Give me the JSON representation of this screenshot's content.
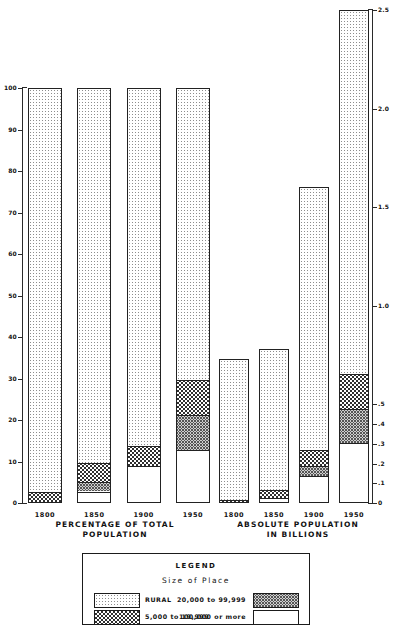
{
  "chart_data": [
    {
      "type": "bar",
      "title": "PERCENTAGE OF TOTAL POPULATION",
      "title_line1": "PERCENTAGE OF TOTAL",
      "title_line2": "POPULATION",
      "stacked": true,
      "xlabel": "",
      "ylabel": "",
      "ylim": [
        0,
        100
      ],
      "yticks": [
        0,
        10,
        20,
        30,
        40,
        50,
        60,
        70,
        80,
        90,
        100
      ],
      "ytick_labels": [
        "0",
        "10",
        "20",
        "30",
        "40",
        "50",
        "60",
        "70",
        "80",
        "90",
        "100"
      ],
      "grid": false,
      "legend_position": "bottom",
      "categories": [
        "1800",
        "1850",
        "1900",
        "1950"
      ],
      "series": [
        {
          "name": "100,000 or more",
          "pattern": "white",
          "values": [
            0.0,
            3.0,
            9.2,
            13.1
          ]
        },
        {
          "name": "20,000 to 99,999",
          "pattern": "hatch",
          "values": [
            0.0,
            2.2,
            0.0,
            8.4
          ]
        },
        {
          "name": "5,000 to 19,999",
          "pattern": "check",
          "values": [
            3.0,
            4.8,
            4.8,
            8.5
          ]
        },
        {
          "name": "RURAL",
          "pattern": "rural",
          "values": [
            97.0,
            90.0,
            86.0,
            70.0
          ]
        }
      ]
    },
    {
      "type": "bar",
      "title": "ABSOLUTE POPULATION IN BILLIONS",
      "title_line1": "ABSOLUTE POPULATION",
      "title_line2": "IN BILLIONS",
      "stacked": true,
      "xlabel": "",
      "ylabel": "",
      "ylim": [
        0,
        2.5
      ],
      "yticks": [
        0,
        0.1,
        0.2,
        0.3,
        0.4,
        0.5,
        1.0,
        1.5,
        2.0,
        2.5
      ],
      "ytick_labels": [
        "0",
        ".1",
        ".2",
        ".3",
        ".4",
        ".5",
        "1.0",
        "1.5",
        "2.0",
        "2.5"
      ],
      "grid": false,
      "legend_position": "bottom",
      "categories": [
        "1800",
        "1850",
        "1900",
        "1950"
      ],
      "series": [
        {
          "name": "100,000 or more",
          "pattern": "white",
          "values": [
            0.0,
            0.03,
            0.14,
            0.31
          ]
        },
        {
          "name": "20,000 to 99,999",
          "pattern": "hatch",
          "values": [
            0.0,
            0.0,
            0.05,
            0.17
          ]
        },
        {
          "name": "5,000 to 19,999",
          "pattern": "check",
          "values": [
            0.02,
            0.04,
            0.08,
            0.18
          ]
        },
        {
          "name": "RURAL",
          "pattern": "rural",
          "values": [
            0.71,
            0.71,
            1.33,
            1.84
          ]
        }
      ],
      "totals": [
        0.73,
        0.78,
        1.6,
        2.5
      ]
    }
  ],
  "legend": {
    "title": "LEGEND",
    "subtitle": "Size of Place",
    "items": [
      {
        "label": "RURAL",
        "pattern": "rural"
      },
      {
        "label": "20,000 to 99,999",
        "pattern": "hatch"
      },
      {
        "label": "5,000 to 19,999",
        "pattern": "check"
      },
      {
        "label": "100,000 or more",
        "pattern": "white"
      }
    ]
  },
  "colors": {
    "ink": "#1b1b1b",
    "rural_dot": "#8d8d8d",
    "check_dark": "#2f2f2f",
    "hatch_bg": "#cfcfcf",
    "hatch_line": "#555555",
    "background": "#ffffff"
  }
}
